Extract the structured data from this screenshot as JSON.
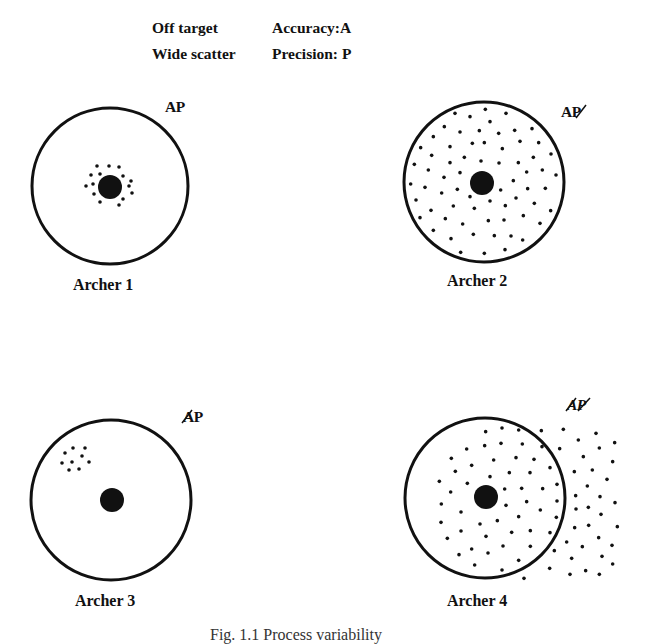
{
  "legend": {
    "rows": [
      {
        "key": "Off target",
        "value": "Accuracy:A"
      },
      {
        "key": "Wide scatter",
        "value": "Precision: P"
      }
    ]
  },
  "targets": [
    {
      "label": "Archer 1",
      "ap": "AP",
      "ap_marks": "none",
      "center": [
        110,
        186
      ],
      "radius": 78,
      "bullseye": [
        110,
        187
      ],
      "bullseye_r": 12,
      "shots": [
        [
          97,
          166
        ],
        [
          109,
          166
        ],
        [
          119,
          167
        ],
        [
          91,
          175
        ],
        [
          100,
          174
        ],
        [
          123,
          176
        ],
        [
          131,
          181
        ],
        [
          86,
          186
        ],
        [
          93,
          184
        ],
        [
          129,
          186
        ],
        [
          132,
          193
        ],
        [
          94,
          194
        ],
        [
          100,
          202
        ],
        [
          123,
          199
        ],
        [
          119,
          205
        ]
      ]
    },
    {
      "label": "Archer 2",
      "ap": "AP",
      "ap_marks": "P struck",
      "center": [
        484,
        182
      ],
      "radius": 80,
      "bullseye": [
        482,
        183
      ],
      "bullseye_r": 12,
      "shots": []
    },
    {
      "label": "Archer 3",
      "ap": "AP",
      "ap_marks": "A struck",
      "center": [
        111,
        500
      ],
      "radius": 80,
      "bullseye": [
        112,
        500
      ],
      "bullseye_r": 12,
      "shots": [
        [
          65,
          453
        ],
        [
          73,
          448
        ],
        [
          85,
          448
        ],
        [
          82,
          456
        ],
        [
          62,
          463
        ],
        [
          72,
          462
        ],
        [
          89,
          462
        ],
        [
          69,
          470
        ],
        [
          79,
          469
        ]
      ]
    },
    {
      "label": "Archer 4",
      "ap": "AP",
      "ap_marks": "A and P struck",
      "center": [
        485,
        498
      ],
      "radius": 80,
      "bullseye": [
        486,
        497
      ],
      "bullseye_r": 12,
      "shots": []
    }
  ],
  "caption": "Fig. 1.1   Process variability"
}
